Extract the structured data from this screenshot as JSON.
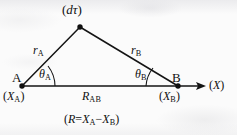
{
  "figure": {
    "type": "geometry-diagram",
    "ink_color": "#101010",
    "background_color": "#fbfbfb",
    "labels": {
      "apex": {
        "open": "(",
        "symbol": "dτ",
        "close": ")"
      },
      "leg_left": {
        "symbol": "r",
        "subscript": "A"
      },
      "leg_right": {
        "symbol": "r",
        "subscript": "B"
      },
      "angle_left": {
        "symbol": "θ",
        "subscript": "A"
      },
      "angle_right": {
        "symbol": "θ",
        "subscript": "B"
      },
      "vertex_left": {
        "symbol": "A"
      },
      "vertex_right": {
        "symbol": "B"
      },
      "coord_left": {
        "open": "(",
        "symbol": "X",
        "subscript": "A",
        "close": ")"
      },
      "coord_right": {
        "open": "(",
        "symbol": "X",
        "subscript": "B",
        "close": ")"
      },
      "baseline": {
        "symbol": "R",
        "subscript": "AB"
      },
      "axis": {
        "open": "(",
        "symbol": "X",
        "close": ")"
      },
      "formula": {
        "open": "(",
        "lhs": "R",
        "equals": "=",
        "term1": "X",
        "term1_sub": "A",
        "minus": "−",
        "term2": "X",
        "term2_sub": "B",
        "close": ")"
      }
    },
    "geometry": {
      "apex": {
        "x": 80,
        "y": 27
      },
      "vertex_a": {
        "x": 22,
        "y": 86
      },
      "vertex_b": {
        "x": 178,
        "y": 86
      },
      "axis_arrow_tip": {
        "x": 206,
        "y": 86
      }
    }
  }
}
